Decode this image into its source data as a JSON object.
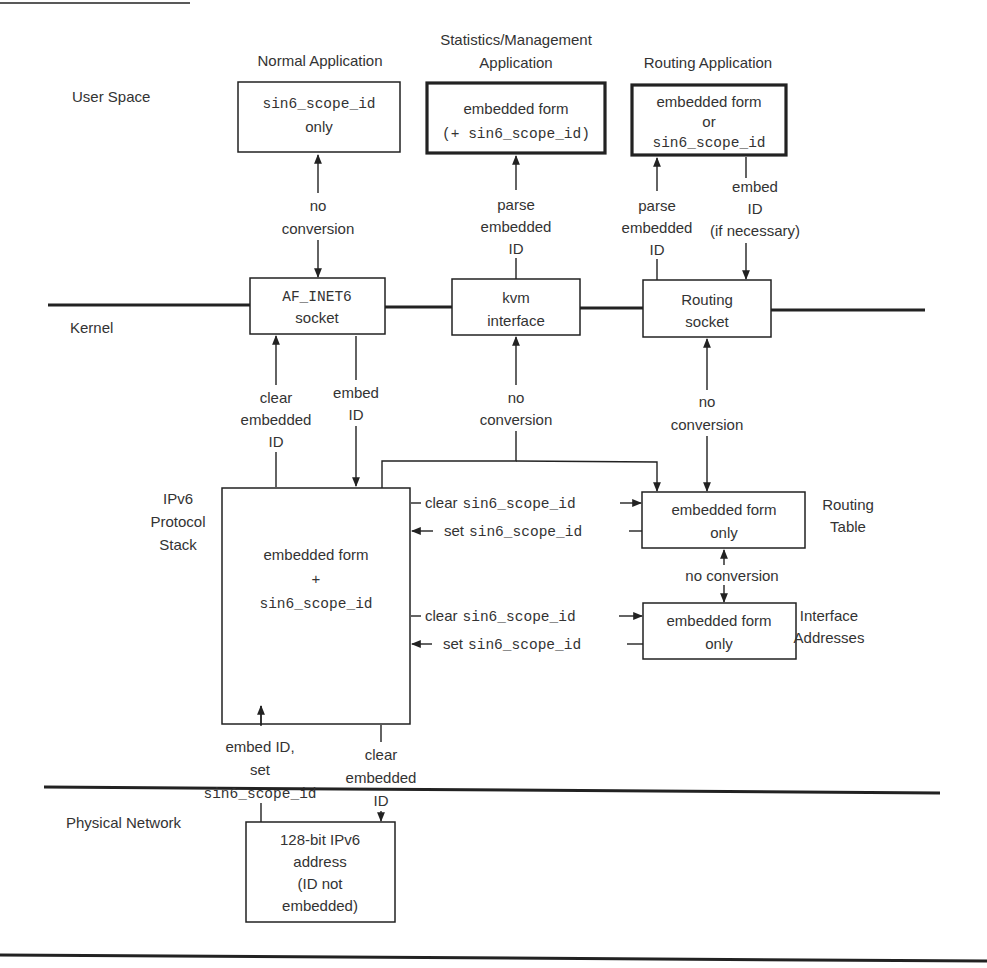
{
  "layers": {
    "user_space": "User Space",
    "kernel": "Kernel",
    "ipv6_stack": [
      "IPv6",
      "Protocol",
      "Stack"
    ],
    "physical_network": "Physical Network"
  },
  "applications": {
    "normal": {
      "title": "Normal Application",
      "box": [
        "sin6_scope_id",
        "only"
      ]
    },
    "stats": {
      "title": [
        "Statistics/Management",
        "Application"
      ],
      "box": [
        "embedded form",
        "(+ sin6_scope_id)"
      ]
    },
    "routing": {
      "title": "Routing Application",
      "box": [
        "embedded form",
        "or",
        "sin6_scope_id"
      ]
    }
  },
  "kernel_boxes": {
    "af_inet6": [
      "AF_INET6",
      "socket"
    ],
    "kvm": [
      "kvm",
      "interface"
    ],
    "routing_socket": [
      "Routing",
      "socket"
    ]
  },
  "stack_box": [
    "embedded form",
    "+",
    "sin6_scope_id"
  ],
  "routing_table": {
    "box": [
      "embedded form",
      "only"
    ],
    "label": [
      "Routing",
      "Table"
    ]
  },
  "interface_addresses": {
    "box": [
      "embedded form",
      "only"
    ],
    "label": [
      "Interface",
      "Addresses"
    ]
  },
  "physical_box": [
    "128-bit IPv6",
    "address",
    "(ID not",
    "embedded)"
  ],
  "edge_labels": {
    "normal_no_conversion": [
      "no",
      "conversion"
    ],
    "stats_parse": [
      "parse",
      "embedded",
      "ID"
    ],
    "routing_parse": [
      "parse",
      "embedded",
      "ID"
    ],
    "routing_embed": [
      "embed",
      "ID",
      "(if necessary)"
    ],
    "af_clear": [
      "clear",
      "embedded",
      "ID"
    ],
    "af_embed": [
      "embed",
      "ID"
    ],
    "kvm_no_conversion": [
      "no",
      "conversion"
    ],
    "rsock_no_conversion": [
      "no",
      "conversion"
    ],
    "rt_clear": {
      "word": "clear",
      "code": "sin6_scope_id"
    },
    "rt_set": {
      "word": "set",
      "code": "sin6_scope_id"
    },
    "rt_if_no_conversion": "no conversion",
    "if_clear": {
      "word": "clear",
      "code": "sin6_scope_id"
    },
    "if_set": {
      "word": "set",
      "code": "sin6_scope_id"
    },
    "phys_embed": [
      "embed ID,",
      "set",
      "sin6_scope_id"
    ],
    "phys_clear": [
      "clear",
      "embedded",
      "ID"
    ]
  }
}
